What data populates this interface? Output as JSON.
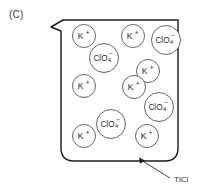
{
  "figure": {
    "panel_label": "(C)",
    "background_color": "#ffffff",
    "outline_color": "#1d1d1d",
    "circle_stroke_color": "#4a4a4a",
    "precipitate_color": "#b9b6b4"
  },
  "beaker": {
    "name": "beaker-with-spout",
    "left": 61,
    "right": 178,
    "top": 20,
    "bottom": 161,
    "spout_tip_x": 51,
    "spout_tip_y": 27,
    "corner_radius": 13
  },
  "precipitate": {
    "label": "TlCl",
    "description": "gray solid settled at beaker bottom"
  },
  "callout": {
    "label": "TlCl",
    "text_x": 176,
    "text_y": 182,
    "arrow_tip_x": 139,
    "arrow_tip_y": 158
  },
  "ions": [
    {
      "id": "k-1",
      "species": "K",
      "charge": "+",
      "x": 84,
      "y": 36,
      "r": 11.5
    },
    {
      "id": "k-2",
      "species": "K",
      "charge": "+",
      "x": 133,
      "y": 36,
      "r": 11.5
    },
    {
      "id": "clo4-1",
      "species": "ClO",
      "sub": "4",
      "charge": "−",
      "x": 166,
      "y": 40,
      "r": 14.5
    },
    {
      "id": "clo4-2",
      "species": "ClO",
      "sub": "4",
      "charge": "−",
      "x": 104,
      "y": 58,
      "r": 14.5
    },
    {
      "id": "k-3",
      "species": "K",
      "charge": "+",
      "x": 148,
      "y": 71,
      "r": 11.5
    },
    {
      "id": "k-4",
      "species": "K",
      "charge": "+",
      "x": 84,
      "y": 86,
      "r": 11.5
    },
    {
      "id": "k-5",
      "species": "K",
      "charge": "+",
      "x": 134,
      "y": 87,
      "r": 11.5
    },
    {
      "id": "clo4-3",
      "species": "ClO",
      "sub": "4",
      "charge": "−",
      "x": 159,
      "y": 107,
      "r": 14.5
    },
    {
      "id": "clo4-4",
      "species": "ClO",
      "sub": "4",
      "charge": "−",
      "x": 111,
      "y": 124,
      "r": 14.5
    },
    {
      "id": "k-6",
      "species": "K",
      "charge": "+",
      "x": 84,
      "y": 136,
      "r": 11.5
    },
    {
      "id": "k-7",
      "species": "K",
      "charge": "+",
      "x": 147,
      "y": 136,
      "r": 11.5
    }
  ]
}
